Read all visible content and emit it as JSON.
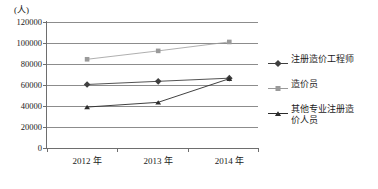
{
  "chart_data": {
    "type": "line",
    "title": "",
    "xlabel": "",
    "ylabel": "(人)",
    "y_unit_label": "(人)",
    "categories": [
      "2012 年",
      "2013 年",
      "2014 年"
    ],
    "ylim": [
      0,
      120000
    ],
    "y_ticks": [
      0,
      20000,
      40000,
      60000,
      80000,
      100000,
      120000
    ],
    "y_tick_labels": [
      "0",
      "20000",
      "40000",
      "60000",
      "80000",
      "100000",
      "120000"
    ],
    "grid": true,
    "legend_position": "right",
    "series": [
      {
        "name": "注册造价工程师",
        "marker": "diamond",
        "color": "#3f3f3f",
        "values": [
          60500,
          63500,
          66500
        ]
      },
      {
        "name": "造价员",
        "marker": "square",
        "color": "#9a9a9a",
        "values": [
          84500,
          92500,
          101000
        ]
      },
      {
        "name": "其他专业注册造价人员",
        "marker": "triangle",
        "color": "#2b2b2b",
        "values": [
          39000,
          43500,
          66000
        ]
      }
    ]
  },
  "legend": {
    "items": [
      {
        "label": "注册造价工程师",
        "marker": "diamond-marker",
        "color": "#3f3f3f"
      },
      {
        "label": "造价员",
        "marker": "square-marker",
        "color": "#9a9a9a"
      },
      {
        "label": "其他专业注册造\n价人员",
        "marker": "triangle-marker",
        "color": "#2b2b2b"
      }
    ]
  },
  "colors": {
    "grid": "#8c8c8c",
    "axis": "#6e6e6e",
    "text": "#1a1a1a",
    "background": "#ffffff"
  }
}
